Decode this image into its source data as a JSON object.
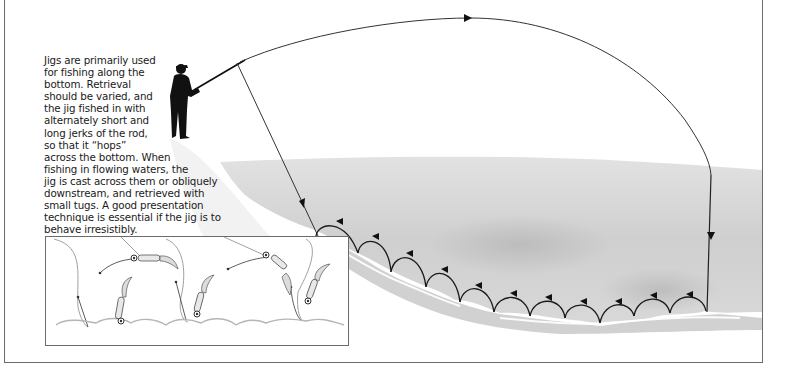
{
  "figure": {
    "description_lines": [
      "Jigs are primarily used",
      "for fishing along the",
      "bottom. Retrieval",
      "should be varied, and",
      "the jig fished in with",
      "alternately short and",
      "long jerks of the rod,",
      "so that it “hops”",
      "across the bottom. When",
      "fishing in flowing waters, the",
      "jig is cast across them or obliquely",
      "downstream, and retrieved with",
      "small tugs. A good presentation",
      "technique is essential if the jig is to",
      "behave irresistibly."
    ],
    "elements": {
      "angler": "angler-silhouette",
      "cast_arc": "cast-trajectory-arc",
      "retrieve_hops": 12,
      "inset": "jig-hopping-detail",
      "inset_jigs": 4
    },
    "colors": {
      "line": "#222222",
      "water": "#d4d4d4",
      "water_dark": "#bdbdbd",
      "shore": "#eeeeee",
      "frame": "#6b6b6b",
      "text": "#1a1a1a"
    }
  }
}
